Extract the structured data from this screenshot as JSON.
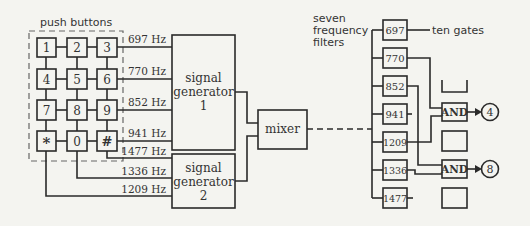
{
  "labels": {
    "push_buttons": "push buttons",
    "seven_filters": [
      "seven",
      "frequency",
      "filters"
    ],
    "ten_gates": "ten gates"
  },
  "keypad": {
    "rows": [
      [
        "1",
        "2",
        "3"
      ],
      [
        "4",
        "5",
        "6"
      ],
      [
        "7",
        "8",
        "9"
      ],
      [
        "*",
        "0",
        "#"
      ]
    ]
  },
  "frequencies_to_gen1": [
    "697 Hz",
    "770 Hz",
    "852 Hz",
    "941 Hz"
  ],
  "frequencies_to_gen2": [
    "1477 Hz",
    "1336 Hz",
    "1209 Hz"
  ],
  "signal_generator_1": [
    "signal",
    "generator",
    "1"
  ],
  "signal_generator_2": [
    "signal",
    "generator",
    "2"
  ],
  "mixer": "mixer",
  "filters": [
    "697",
    "770",
    "852",
    "941",
    "1209",
    "1336",
    "1477"
  ],
  "gates": {
    "and_label": "AND",
    "outputs": [
      "4",
      "8"
    ]
  }
}
